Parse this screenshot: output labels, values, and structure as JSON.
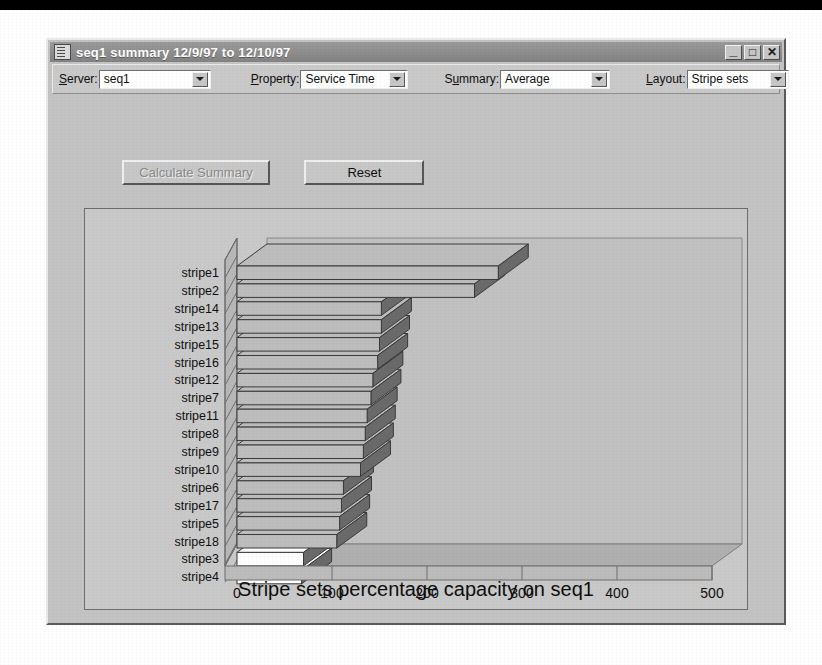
{
  "window": {
    "title": "seq1 summary 12/9/97 to 12/10/97",
    "icon": "document-icon",
    "minimize_label": "_",
    "maximize_label": "□",
    "close_label": "✕"
  },
  "toolbar": {
    "fields": [
      {
        "label": "Server:",
        "accel": "S",
        "value": "seq1",
        "name": "server"
      },
      {
        "label": "Property:",
        "accel": "P",
        "value": "Service Time",
        "name": "property"
      },
      {
        "label": "Summary:",
        "accel": "y",
        "value": "Average",
        "name": "summary"
      },
      {
        "label": "Layout:",
        "accel": "L",
        "value": "Stripe sets",
        "name": "layout"
      }
    ]
  },
  "buttons": {
    "calculate_label": "Calculate Summary",
    "calculate_enabled": false,
    "reset_label": "Reset",
    "reset_enabled": true
  },
  "chart_data": {
    "type": "bar",
    "orientation": "horizontal",
    "style": "3d",
    "title": "Stripe sets percentage capacity on seq1",
    "xlabel": "",
    "ylabel": "",
    "xlim": [
      0,
      500
    ],
    "xticks": [
      0,
      100,
      200,
      300,
      400,
      500
    ],
    "ticklabels": [
      "0",
      "100",
      "200",
      "300",
      "400",
      "500"
    ],
    "grid": false,
    "legend": "none",
    "categories": [
      "stripe1",
      "stripe2",
      "stripe14",
      "stripe13",
      "stripe15",
      "stripe16",
      "stripe12",
      "stripe7",
      "stripe11",
      "stripe8",
      "stripe9",
      "stripe10",
      "stripe6",
      "stripe17",
      "stripe5",
      "stripe18",
      "stripe3",
      "stripe4"
    ],
    "values": [
      275,
      250,
      152,
      152,
      150,
      148,
      143,
      141,
      137,
      135,
      133,
      130,
      112,
      110,
      108,
      105,
      70,
      68
    ],
    "bar_fill": "#bdbdbd",
    "bar_side": "#6a6a6a",
    "highlight_fill": "#ffffff",
    "highlight_indices": [
      16,
      17
    ],
    "floor_color": "#b0b0b0",
    "wall_color": "#c1c1c1",
    "panel_color": "#c9c9c9"
  }
}
